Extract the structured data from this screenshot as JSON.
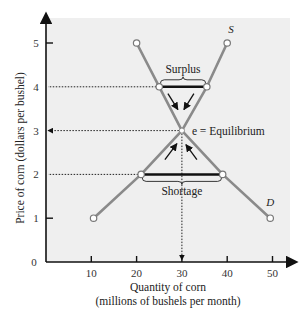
{
  "chart_data": {
    "type": "line",
    "title": "",
    "xlabel": "Quantity of corn",
    "xlabel_sub": "(millions of bushels per month)",
    "ylabel": "Price of corn (dollars per bushel)",
    "xlim": [
      0,
      52
    ],
    "ylim": [
      0,
      5.4
    ],
    "x_ticks": [
      10,
      20,
      30,
      40,
      50
    ],
    "y_ticks": [
      0,
      1,
      2,
      3,
      4,
      5
    ],
    "grid": false,
    "series": [
      {
        "name": "D",
        "label": "D",
        "points": [
          [
            20,
            5
          ],
          [
            25,
            4
          ],
          [
            30,
            3
          ],
          [
            39,
            2
          ],
          [
            49.5,
            1
          ]
        ]
      },
      {
        "name": "S",
        "label": "S",
        "points": [
          [
            10.5,
            1
          ],
          [
            21,
            2
          ],
          [
            30,
            3
          ],
          [
            35.5,
            4
          ],
          [
            40,
            5
          ]
        ]
      }
    ],
    "annotations": {
      "surplus": {
        "label": "Surplus",
        "price": 4,
        "from_q": 25,
        "to_q": 35.5
      },
      "shortage": {
        "label": "Shortage",
        "price": 2,
        "from_q": 21,
        "to_q": 39
      },
      "equilibrium": {
        "label": "e = Equilibrium",
        "q": 30,
        "p": 3
      }
    },
    "reference_lines": [
      {
        "type": "horizontal",
        "y": 4,
        "style": "dotted"
      },
      {
        "type": "horizontal",
        "y": 3,
        "style": "dotted-arrow"
      },
      {
        "type": "horizontal",
        "y": 2,
        "style": "dotted"
      },
      {
        "type": "vertical",
        "x": 30,
        "style": "dotted-arrow"
      }
    ],
    "colors": {
      "panel": "#efefef",
      "curve": "#8a8a8a",
      "axis": "#111111",
      "gap_bar": "#111111"
    }
  }
}
